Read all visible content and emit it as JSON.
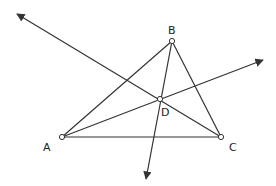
{
  "diagram": {
    "type": "geometry",
    "colors": {
      "stroke": "#333333",
      "point_fill": "#ffffff",
      "label": "#222222"
    },
    "points": {
      "A": {
        "label": "A",
        "x": 62,
        "y": 137,
        "label_x": 43,
        "label_y": 151
      },
      "B": {
        "label": "B",
        "x": 172,
        "y": 41,
        "label_x": 168,
        "label_y": 34
      },
      "C": {
        "label": "C",
        "x": 221,
        "y": 137,
        "label_x": 229,
        "label_y": 151
      },
      "D": {
        "label": "D",
        "x": 160,
        "y": 99,
        "label_x": 161,
        "label_y": 116
      }
    },
    "segments": [
      [
        "A",
        "B"
      ],
      [
        "B",
        "C"
      ],
      [
        "A",
        "C"
      ]
    ],
    "rays": [
      {
        "from": "C",
        "through": "D",
        "arrow_tip": [
          16,
          13
        ]
      },
      {
        "from": "A",
        "through": "D",
        "arrow_tip": [
          264,
          60
        ]
      },
      {
        "from": "B",
        "through": "D",
        "arrow_tip": [
          146,
          180
        ]
      }
    ]
  }
}
